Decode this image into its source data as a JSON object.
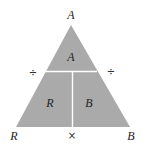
{
  "diagram": {
    "fill_color": "#aaaaaa",
    "divider_color": "#ffffff",
    "vertices": {
      "top": "A",
      "bottom_left": "R",
      "bottom_right": "B"
    },
    "sections": {
      "top": "A",
      "bottom_left": "R",
      "bottom_right": "B"
    },
    "operators": {
      "left": "÷",
      "right": "÷",
      "bottom": "×"
    }
  }
}
